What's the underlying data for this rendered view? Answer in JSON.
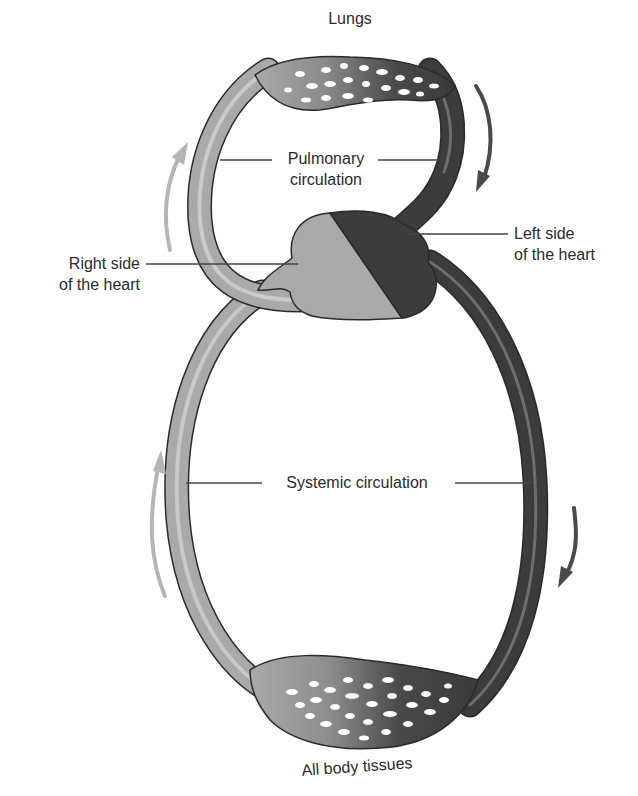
{
  "diagram": {
    "type": "circulatory-system-schematic",
    "labels": {
      "lungs": "Lungs",
      "pulmonary_line1": "Pulmonary",
      "pulmonary_line2": "circulation",
      "right_heart_line1": "Right side",
      "right_heart_line2": "of the heart",
      "left_heart_line1": "Left side",
      "left_heart_line2": "of the heart",
      "systemic": "Systemic circulation",
      "body_tissues": "All body tissues"
    },
    "colors": {
      "deoxygenated": "#a9a9a9",
      "oxygenated": "#3c3c3c",
      "arrow_light": "#b5b5b5",
      "arrow_dark": "#4a4a4a",
      "outline": "#2a2a2a",
      "text": "#2b2b2b"
    },
    "arrows": [
      {
        "id": "pulmonary-up",
        "direction": "up",
        "shade": "light"
      },
      {
        "id": "pulmonary-down",
        "direction": "down",
        "shade": "dark"
      },
      {
        "id": "systemic-up",
        "direction": "up",
        "shade": "light"
      },
      {
        "id": "systemic-down",
        "direction": "down",
        "shade": "dark"
      }
    ]
  }
}
